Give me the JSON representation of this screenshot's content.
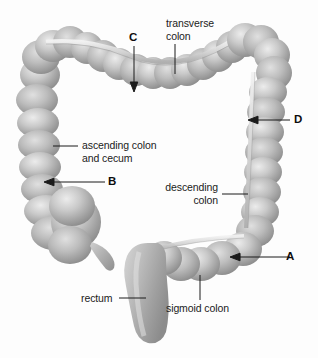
{
  "figure": {
    "background_color": "#fdfdfd",
    "ink_color": "#1b1b1b",
    "organ_fill": "#b9b9b9",
    "organ_shadow": "#8a8a8a",
    "organ_highlight": "#e8e8e8"
  },
  "labels": {
    "transverse_colon": "transverse\ncolon",
    "ascending_colon": "ascending colon\nand cecum",
    "descending_colon": "descending\ncolon",
    "sigmoid_colon": "sigmoid colon",
    "rectum": "rectum"
  },
  "markers": {
    "a": "A",
    "b": "B",
    "c": "C",
    "d": "D"
  }
}
